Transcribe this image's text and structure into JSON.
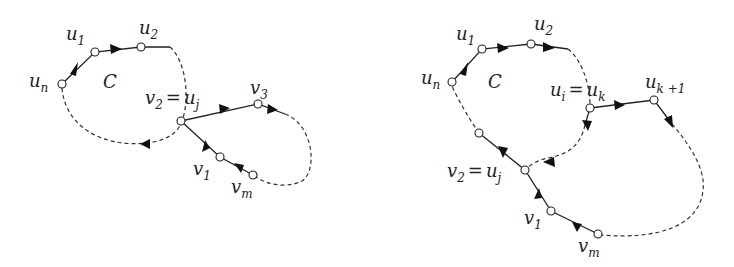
{
  "figures": [
    {
      "id": "left",
      "cycle_label": "C",
      "labels": {
        "u1": {
          "base": "u",
          "sub": "1"
        },
        "u2": {
          "base": "u",
          "sub": "2"
        },
        "un": {
          "base": "u",
          "sub": "n"
        },
        "v2_eq": {
          "base": "v",
          "sub": "2",
          "eq": "=",
          "base2": "u",
          "sub2": "j"
        },
        "v3": {
          "base": "v",
          "sub": "3"
        },
        "v1": {
          "base": "v",
          "sub": "1"
        },
        "vm": {
          "base": "v",
          "sub": "m"
        }
      }
    },
    {
      "id": "right",
      "cycle_label": "C",
      "labels": {
        "u1": {
          "base": "u",
          "sub": "1"
        },
        "u2": {
          "base": "u",
          "sub": "2"
        },
        "un": {
          "base": "u",
          "sub": "n"
        },
        "ui_eq": {
          "base": "u",
          "sub": "i",
          "eq": "=",
          "base2": "u",
          "sub2": "k"
        },
        "uk1": {
          "base": "u",
          "sub": "k +1"
        },
        "v2_eq": {
          "base": "v",
          "sub": "2",
          "eq": "=",
          "base2": "u",
          "sub2": "j"
        },
        "v1": {
          "base": "v",
          "sub": "1"
        },
        "vm": {
          "base": "v",
          "sub": "m"
        }
      }
    }
  ],
  "colors": {
    "stroke": "#222222",
    "background": "#ffffff"
  }
}
